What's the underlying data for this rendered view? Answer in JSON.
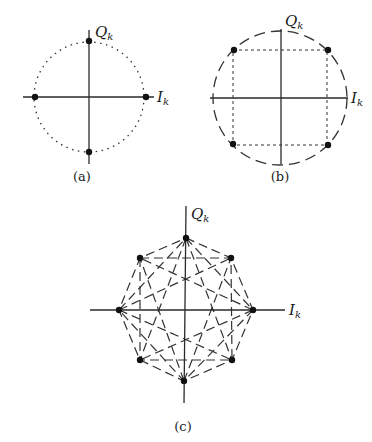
{
  "figure": {
    "panels": [
      {
        "id": "a",
        "caption": "(a)",
        "description": "Binary/4-point constellation on dotted circle",
        "axis_labels": {
          "horizontal": "I",
          "horizontal_sub": "k",
          "vertical": "Q",
          "vertical_sub": "k"
        },
        "boundary": "dotted-circle",
        "points": [
          {
            "angle_deg": 0
          },
          {
            "angle_deg": 90
          },
          {
            "angle_deg": 180
          },
          {
            "angle_deg": 270
          }
        ]
      },
      {
        "id": "b",
        "caption": "(b)",
        "description": "QPSK constellation with dashed circle and dotted square",
        "axis_labels": {
          "horizontal": "I",
          "horizontal_sub": "k",
          "vertical": "Q",
          "vertical_sub": "k"
        },
        "boundary": "dashed-circle",
        "points": [
          {
            "angle_deg": 45
          },
          {
            "angle_deg": 135
          },
          {
            "angle_deg": 225
          },
          {
            "angle_deg": 315
          }
        ]
      },
      {
        "id": "c",
        "caption": "(c)",
        "description": "8-PSK constellation with dashed transitions between points",
        "axis_labels": {
          "horizontal": "I",
          "horizontal_sub": "k",
          "vertical": "Q",
          "vertical_sub": "k"
        },
        "boundary": "dashed-transitions",
        "points": [
          {
            "angle_deg": 0
          },
          {
            "angle_deg": 45
          },
          {
            "angle_deg": 90
          },
          {
            "angle_deg": 135
          },
          {
            "angle_deg": 180
          },
          {
            "angle_deg": 225
          },
          {
            "angle_deg": 270
          },
          {
            "angle_deg": 315
          }
        ]
      }
    ]
  },
  "colors": {
    "ink": "#111111",
    "line": "#333333",
    "background": "#ffffff"
  }
}
